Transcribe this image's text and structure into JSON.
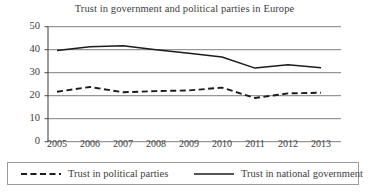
{
  "chart_data": {
    "type": "line",
    "title": "Trust in government and political parties in Europe",
    "xlabel": "",
    "ylabel": "",
    "categories": [
      "2005",
      "2006",
      "2007",
      "2008",
      "2009",
      "2010",
      "2011",
      "2012",
      "2013"
    ],
    "x": [
      2005,
      2006,
      2007,
      2008,
      2009,
      2010,
      2011,
      2012,
      2013
    ],
    "ylim": [
      0,
      50
    ],
    "yticks": [
      0,
      10,
      20,
      30,
      40,
      50
    ],
    "ytick_labels": [
      "0",
      "10",
      "20",
      "30",
      "40",
      "50"
    ],
    "grid": "horizontal",
    "legend_position": "bottom",
    "series": [
      {
        "name": "Trust in political parties",
        "style": "dashed",
        "color": "#1c1c1c",
        "values": [
          21.7,
          23.8,
          21.5,
          22.0,
          22.3,
          23.5,
          19.0,
          21.0,
          21.3
        ]
      },
      {
        "name": "Trust in national government",
        "style": "solid",
        "color": "#1c1c1c",
        "values": [
          39.7,
          41.3,
          41.7,
          40.0,
          38.5,
          36.8,
          32.0,
          33.5,
          32.2
        ]
      }
    ]
  },
  "legend": {
    "entries": [
      {
        "label": "Trust in political parties",
        "style": "dashed"
      },
      {
        "label": "Trust in national government",
        "style": "solid"
      }
    ]
  },
  "colors": {
    "line": "#1c1c1c",
    "grid": "#6f6f6f",
    "axis": "#4a4a4a",
    "text": "#3d3d3d",
    "background": "#ffffff"
  }
}
